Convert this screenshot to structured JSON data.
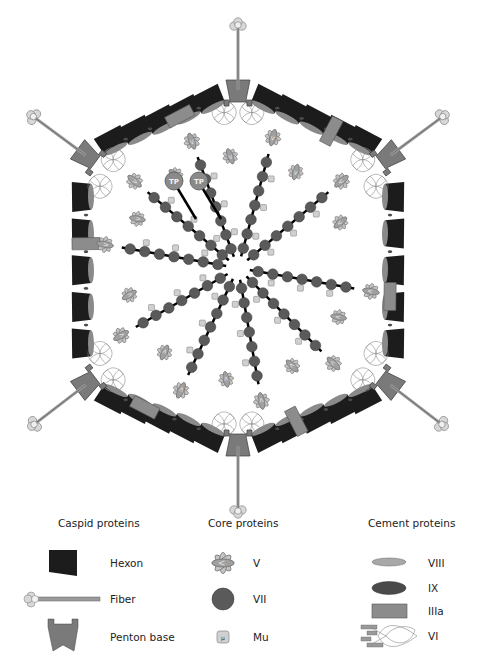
{
  "colors": {
    "hexon": "#1c1c1c",
    "penton": "#7a7a7a",
    "penton_stroke": "#3a3a3a",
    "fiber": "#9a9a9a",
    "knob": "#d8d8d8",
    "core_vii": "#5a5a5a",
    "dna": "#000000",
    "protein_v": "#b8b8b8",
    "protein_v_inner": "#8e8e8e",
    "mu": "#d0d0d0",
    "viii": "#a8a8a8",
    "ix": "#4a4a4a",
    "iiia": "#8c8c8c",
    "vi": "#9a9a9a",
    "tp": "#8a8a8a"
  },
  "diagram": {
    "center": [
      238,
      268
    ],
    "terminal_protein_label": "TP",
    "terminal_proteins": [
      {
        "label": "TP",
        "x": 174,
        "y": 181
      },
      {
        "label": "TP",
        "x": 199,
        "y": 181
      }
    ],
    "vertex_count": 6,
    "penton_count": 6
  },
  "legend": {
    "groups": [
      {
        "title": "Caspid proteins",
        "items": [
          {
            "label": "Hexon",
            "icon": "hexon-icon"
          },
          {
            "label": "Fiber",
            "icon": "fiber-icon"
          },
          {
            "label": "Penton base",
            "icon": "penton-base-icon"
          }
        ]
      },
      {
        "title": "Core proteins",
        "items": [
          {
            "label": "V",
            "icon": "protein-v-icon"
          },
          {
            "label": "VII",
            "icon": "protein-vii-icon"
          },
          {
            "label": "Mu",
            "icon": "protein-mu-icon",
            "glyph": "μ"
          }
        ]
      },
      {
        "title": "Cement proteins",
        "items": [
          {
            "label": "VIII",
            "icon": "protein-viii-icon"
          },
          {
            "label": "IX",
            "icon": "protein-ix-icon"
          },
          {
            "label": "IIIa",
            "icon": "protein-iiia-icon"
          },
          {
            "label": "VI",
            "icon": "protein-vi-icon"
          }
        ]
      }
    ]
  }
}
